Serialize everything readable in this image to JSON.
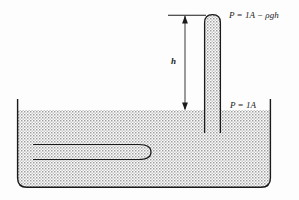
{
  "figure": {
    "type": "physics-diagram",
    "background_color": "#fdfdfd",
    "line_color": "#1a1a1a",
    "fill_pattern": "stipple-dots",
    "fill_color": "#9a9a9a"
  },
  "labels": {
    "top_pressure": "P = 1A − ρgh",
    "top_pressure_parts": {
      "p": "P",
      "equals": "=",
      "atm": "1A",
      "minus": "−",
      "term": "ρgh"
    },
    "bottom_pressure": "P = 1A",
    "bottom_pressure_parts": {
      "p": "P",
      "equals": "=",
      "atm": "1A"
    },
    "height": "h"
  },
  "elements": {
    "tank": "liquid-tank",
    "tube": "vertical-capillary-tube",
    "submerged_tube": "horizontal-u-tube",
    "dimension_line": "height-dimension-arrow",
    "liquid_surface": "free-surface"
  },
  "geometry": {
    "tank_left": 17,
    "tank_right": 271,
    "tank_top": 99,
    "tank_bottom": 188,
    "liquid_surface_y": 110,
    "tube_left": 204,
    "tube_right": 221,
    "tube_top": 14,
    "tube_bottom": 133,
    "dimension_x": 185,
    "dimension_top_y": 15,
    "dimension_bottom_y": 110
  }
}
